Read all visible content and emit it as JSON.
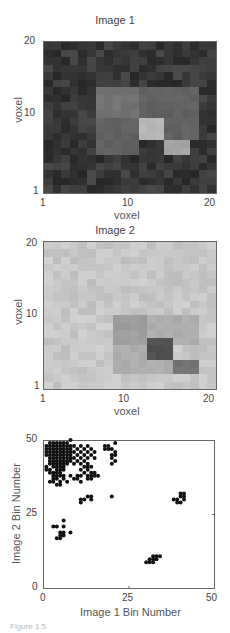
{
  "chart_data": [
    {
      "type": "heatmap",
      "title": "Image 1",
      "xlabel": "voxel",
      "ylabel": "voxel",
      "xticks": [
        "1",
        "10",
        "20"
      ],
      "yticks": [
        "20",
        "10",
        "1"
      ],
      "xlim": [
        1,
        20
      ],
      "ylim": [
        1,
        20
      ],
      "colormap": "gray",
      "description": "Dark noisy background with a brighter block region (x 7-18, y 6-14) containing two bright squares on the diagonal",
      "regions": [
        {
          "x": [
            7,
            11
          ],
          "y": [
            11,
            14
          ],
          "level": 0.45
        },
        {
          "x": [
            12,
            18
          ],
          "y": [
            11,
            14
          ],
          "level": 0.38
        },
        {
          "x": [
            7,
            11
          ],
          "y": [
            6,
            10
          ],
          "level": 0.38
        },
        {
          "x": [
            12,
            14
          ],
          "y": [
            8,
            10
          ],
          "level": 0.72
        },
        {
          "x": [
            15,
            17
          ],
          "y": [
            6,
            7
          ],
          "level": 0.65
        },
        {
          "x": [
            15,
            18
          ],
          "y": [
            8,
            10
          ],
          "level": 0.38
        }
      ]
    },
    {
      "type": "heatmap",
      "title": "Image 2",
      "xlabel": "voxel",
      "ylabel": "voxel",
      "xticks": [
        "1",
        "10",
        "20"
      ],
      "yticks": [
        "20",
        "10",
        "1"
      ],
      "xlim": [
        1,
        20
      ],
      "ylim": [
        1,
        20
      ],
      "colormap": "gray",
      "description": "Light noisy background with a darker block region (x 9-18, y 3-10) containing two dark squares on the diagonal",
      "regions": [
        {
          "x": [
            9,
            12
          ],
          "y": [
            7,
            10
          ],
          "level": 0.62
        },
        {
          "x": [
            13,
            18
          ],
          "y": [
            7,
            10
          ],
          "level": 0.68
        },
        {
          "x": [
            9,
            12
          ],
          "y": [
            3,
            6
          ],
          "level": 0.68
        },
        {
          "x": [
            13,
            15
          ],
          "y": [
            5,
            7
          ],
          "level": 0.32
        },
        {
          "x": [
            16,
            18
          ],
          "y": [
            3,
            4
          ],
          "level": 0.45
        },
        {
          "x": [
            13,
            15
          ],
          "y": [
            3,
            4
          ],
          "level": 0.68
        }
      ]
    },
    {
      "type": "scatter",
      "title": "",
      "xlabel": "Image 1 Bin Number",
      "ylabel": "Image 2 Bin Number",
      "xticks": [
        "0",
        "25",
        "50"
      ],
      "yticks": [
        "50",
        "25",
        "0"
      ],
      "xlim": [
        0,
        50
      ],
      "ylim": [
        0,
        50
      ],
      "grid": false,
      "marker": "filled-circle",
      "points": [
        [
          2,
          49
        ],
        [
          3,
          49
        ],
        [
          4,
          49
        ],
        [
          5,
          49
        ],
        [
          6,
          49
        ],
        [
          7,
          49
        ],
        [
          8,
          50
        ],
        [
          1,
          48
        ],
        [
          2,
          48
        ],
        [
          3,
          48
        ],
        [
          4,
          48
        ],
        [
          5,
          48
        ],
        [
          6,
          48
        ],
        [
          7,
          48
        ],
        [
          8,
          48
        ],
        [
          9,
          48
        ],
        [
          11,
          48
        ],
        [
          13,
          48
        ],
        [
          1,
          47
        ],
        [
          2,
          47
        ],
        [
          3,
          47
        ],
        [
          4,
          47
        ],
        [
          5,
          47
        ],
        [
          6,
          47
        ],
        [
          7,
          47
        ],
        [
          8,
          47
        ],
        [
          10,
          47
        ],
        [
          12,
          47
        ],
        [
          14,
          47
        ],
        [
          1,
          46
        ],
        [
          2,
          46
        ],
        [
          3,
          46
        ],
        [
          4,
          46
        ],
        [
          5,
          46
        ],
        [
          6,
          46
        ],
        [
          7,
          46
        ],
        [
          8,
          46
        ],
        [
          9,
          46
        ],
        [
          11,
          46
        ],
        [
          13,
          46
        ],
        [
          15,
          46
        ],
        [
          1,
          45
        ],
        [
          2,
          45
        ],
        [
          3,
          45
        ],
        [
          4,
          45
        ],
        [
          5,
          45
        ],
        [
          6,
          45
        ],
        [
          7,
          45
        ],
        [
          8,
          45
        ],
        [
          10,
          45
        ],
        [
          12,
          45
        ],
        [
          14,
          45
        ],
        [
          2,
          44
        ],
        [
          3,
          44
        ],
        [
          4,
          44
        ],
        [
          5,
          44
        ],
        [
          6,
          44
        ],
        [
          7,
          44
        ],
        [
          8,
          44
        ],
        [
          9,
          44
        ],
        [
          11,
          44
        ],
        [
          13,
          44
        ],
        [
          15,
          44
        ],
        [
          2,
          43
        ],
        [
          3,
          43
        ],
        [
          4,
          43
        ],
        [
          5,
          43
        ],
        [
          6,
          43
        ],
        [
          7,
          43
        ],
        [
          8,
          43
        ],
        [
          10,
          43
        ],
        [
          12,
          43
        ],
        [
          2,
          42
        ],
        [
          3,
          42
        ],
        [
          4,
          42
        ],
        [
          5,
          42
        ],
        [
          6,
          42
        ],
        [
          7,
          42
        ],
        [
          9,
          42
        ],
        [
          11,
          42
        ],
        [
          13,
          42
        ],
        [
          1,
          41
        ],
        [
          3,
          41
        ],
        [
          4,
          41
        ],
        [
          5,
          41
        ],
        [
          6,
          41
        ],
        [
          12,
          41
        ],
        [
          13,
          41
        ],
        [
          14,
          41
        ],
        [
          1,
          40
        ],
        [
          2,
          40
        ],
        [
          4,
          40
        ],
        [
          5,
          40
        ],
        [
          6,
          40
        ],
        [
          11,
          40
        ],
        [
          13,
          40
        ],
        [
          2,
          39
        ],
        [
          3,
          39
        ],
        [
          4,
          39
        ],
        [
          5,
          39
        ],
        [
          12,
          39
        ],
        [
          14,
          39
        ],
        [
          15,
          39
        ],
        [
          3,
          38
        ],
        [
          4,
          38
        ],
        [
          5,
          38
        ],
        [
          6,
          38
        ],
        [
          8,
          38
        ],
        [
          10,
          38
        ],
        [
          11,
          38
        ],
        [
          13,
          38
        ],
        [
          14,
          38
        ],
        [
          15,
          38
        ],
        [
          16,
          38
        ],
        [
          3,
          37
        ],
        [
          4,
          37
        ],
        [
          6,
          37
        ],
        [
          9,
          37
        ],
        [
          10,
          37
        ],
        [
          13,
          37
        ],
        [
          14,
          37
        ],
        [
          2,
          36
        ],
        [
          3,
          36
        ],
        [
          5,
          36
        ],
        [
          7,
          36
        ],
        [
          11,
          36
        ],
        [
          4,
          35
        ],
        [
          5,
          35
        ],
        [
          18,
          48
        ],
        [
          19,
          48
        ],
        [
          18,
          47
        ],
        [
          19,
          47
        ],
        [
          21,
          49
        ],
        [
          20,
          47
        ],
        [
          21,
          46
        ],
        [
          20,
          45
        ],
        [
          21,
          45
        ],
        [
          20,
          44
        ],
        [
          21,
          43
        ],
        [
          20,
          42
        ],
        [
          11,
          30
        ],
        [
          12,
          30
        ],
        [
          11,
          29
        ],
        [
          13,
          31
        ],
        [
          14,
          31
        ],
        [
          14,
          30
        ],
        [
          20,
          31
        ],
        [
          38,
          30
        ],
        [
          39,
          30
        ],
        [
          39,
          29
        ],
        [
          40,
          29
        ],
        [
          40,
          31
        ],
        [
          41,
          31
        ],
        [
          41,
          30
        ],
        [
          40,
          32
        ],
        [
          41,
          32
        ],
        [
          3,
          21
        ],
        [
          4,
          21
        ],
        [
          6,
          21
        ],
        [
          6,
          23
        ],
        [
          5,
          19
        ],
        [
          6,
          19
        ],
        [
          4,
          17
        ],
        [
          5,
          17
        ],
        [
          8,
          19
        ],
        [
          5,
          18
        ],
        [
          6,
          18
        ],
        [
          30,
          9
        ],
        [
          31,
          9
        ],
        [
          32,
          9
        ],
        [
          31,
          10
        ],
        [
          32,
          11
        ],
        [
          33,
          11
        ],
        [
          34,
          11
        ],
        [
          33,
          10
        ],
        [
          32,
          10
        ]
      ]
    }
  ],
  "figure": {
    "caption": "Figure 1.5"
  }
}
